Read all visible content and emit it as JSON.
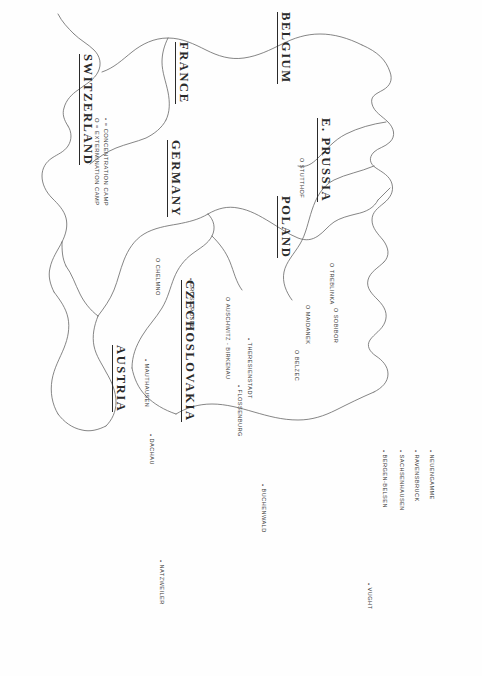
{
  "map": {
    "title": "Nazi Concentration and Extermination Camps in Central Europe",
    "orientation": "rotated-90-clockwise",
    "stroke_color": "#555555",
    "text_color": "#3a3a3a"
  },
  "legend": {
    "concentration": "• = CONCENTRATION CAMP",
    "extermination": "O = EXTERMINATION CAMP"
  },
  "countries": [
    {
      "name": "E. PRUSSIA",
      "label": "E. PRUSSIA"
    },
    {
      "name": "POLAND",
      "label": "POLAND"
    },
    {
      "name": "CZECHOSLOVAKIA",
      "label": "CZECHOSLOVAKIA"
    },
    {
      "name": "AUSTRIA",
      "label": "AUSTRIA"
    },
    {
      "name": "GERMANY",
      "label": "GERMANY"
    },
    {
      "name": "SWITZERLAND",
      "label": "SWITZERLAND"
    },
    {
      "name": "FRANCE",
      "label": "FRANCE"
    },
    {
      "name": "BELGIUM",
      "label": "BELGIUM"
    }
  ],
  "camps": [
    {
      "name": "STUTTHOF",
      "label": "STUTTHOF",
      "type": "extermination",
      "marker": "O"
    },
    {
      "name": "TREBLINKA",
      "label": "TREBLINKA",
      "type": "extermination",
      "marker": "O"
    },
    {
      "name": "SOBIBOR",
      "label": "SOBIBOR",
      "type": "extermination",
      "marker": "O"
    },
    {
      "name": "MAIDANEK",
      "label": "MAIDANEK",
      "type": "extermination",
      "marker": "O"
    },
    {
      "name": "BELZEC",
      "label": "BELZEC",
      "type": "extermination",
      "marker": "O"
    },
    {
      "name": "CHELMNO",
      "label": "CHELMNO",
      "type": "extermination",
      "marker": "O"
    },
    {
      "name": "AUSCHWITZ-BIRKENAU",
      "label": "AUSCHWITZ - BIRKENAU",
      "type": "extermination",
      "marker": "O"
    },
    {
      "name": "GROSS-ROSEN",
      "label": "GROSS-ROSEN",
      "type": "concentration",
      "marker": "•"
    },
    {
      "name": "THERESIENSTADT",
      "label": "THERESIENSTADT",
      "type": "concentration",
      "marker": "•"
    },
    {
      "name": "FLOSSENBURG",
      "label": "FLOSSENBURG",
      "type": "concentration",
      "marker": "•"
    },
    {
      "name": "MAUTHAUSEN",
      "label": "MAUTHAUSEN",
      "type": "concentration",
      "marker": "•"
    },
    {
      "name": "DACHAU",
      "label": "DACHAU",
      "type": "concentration",
      "marker": "•"
    },
    {
      "name": "NEUENGAMME",
      "label": "NEUENGAMME",
      "type": "concentration",
      "marker": "•"
    },
    {
      "name": "RAVENSBRUCK",
      "label": "RAVENSBRUCK",
      "type": "concentration",
      "marker": "•"
    },
    {
      "name": "SACHSENHAUSEN",
      "label": "SACHSENHAUSEN",
      "type": "concentration",
      "marker": "•"
    },
    {
      "name": "BERGEN-BELSEN",
      "label": "BERGEN-BELSEN",
      "type": "concentration",
      "marker": "•"
    },
    {
      "name": "BUCHENWALD",
      "label": "BUCHENWALD",
      "type": "concentration",
      "marker": "•"
    },
    {
      "name": "NATZWEILER",
      "label": "NATZWEILER",
      "type": "concentration",
      "marker": "•"
    },
    {
      "name": "VUGHT",
      "label": "VUGHT",
      "type": "concentration",
      "marker": "•"
    }
  ]
}
